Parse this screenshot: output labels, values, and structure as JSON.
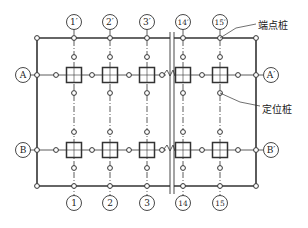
{
  "diagram": {
    "type": "pile-layout-plan",
    "colors": {
      "line": "#333333",
      "bg": "#ffffff"
    },
    "columns_top": [
      {
        "id": "1p",
        "label": "1′",
        "x": 74
      },
      {
        "id": "2p",
        "label": "2′",
        "x": 110
      },
      {
        "id": "3p",
        "label": "3′",
        "x": 147
      },
      {
        "id": "14p",
        "label": "14′",
        "x": 183
      },
      {
        "id": "15p",
        "label": "15′",
        "x": 220
      }
    ],
    "columns_bottom": [
      {
        "id": "1",
        "label": "1",
        "x": 74
      },
      {
        "id": "2",
        "label": "2",
        "x": 110
      },
      {
        "id": "3",
        "label": "3",
        "x": 147
      },
      {
        "id": "14",
        "label": "14",
        "x": 183
      },
      {
        "id": "15",
        "label": "15",
        "x": 220
      }
    ],
    "rows_left": [
      {
        "id": "A",
        "label": "A",
        "y": 75
      },
      {
        "id": "B",
        "label": "B",
        "y": 150
      }
    ],
    "rows_right": [
      {
        "id": "Ap",
        "label": "A′",
        "y": 75
      },
      {
        "id": "Bp",
        "label": "B′",
        "y": 150
      }
    ],
    "annotations": {
      "end_pile": "端点桩",
      "locating_pile": "定位桩"
    }
  }
}
